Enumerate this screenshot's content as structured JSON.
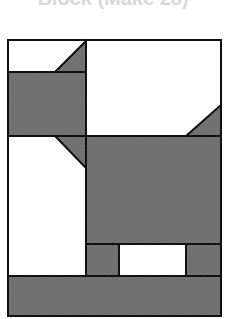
{
  "title": "Block (Make 28)",
  "colors": {
    "fabric_dark": "#6e6e6e",
    "fabric_light": "#ffffff",
    "outline": "#111111",
    "title": "#d8d8d8"
  },
  "diagram": {
    "type": "quilt-block",
    "frame": {
      "x": 8,
      "y": 39,
      "w": 213,
      "h": 277
    },
    "pieces": [
      {
        "name": "top-left-white",
        "fill": "light"
      },
      {
        "name": "top-left-triangle",
        "fill": "dark"
      },
      {
        "name": "head-rectangle",
        "fill": "dark"
      },
      {
        "name": "top-right-white",
        "fill": "light"
      },
      {
        "name": "tail-triangle",
        "fill": "dark"
      },
      {
        "name": "left-column-white",
        "fill": "light"
      },
      {
        "name": "neck-triangle",
        "fill": "dark"
      },
      {
        "name": "body-rectangle",
        "fill": "dark"
      },
      {
        "name": "front-leg",
        "fill": "dark"
      },
      {
        "name": "between-legs-white",
        "fill": "light"
      },
      {
        "name": "back-leg",
        "fill": "dark"
      },
      {
        "name": "bottom-band",
        "fill": "dark"
      }
    ]
  }
}
